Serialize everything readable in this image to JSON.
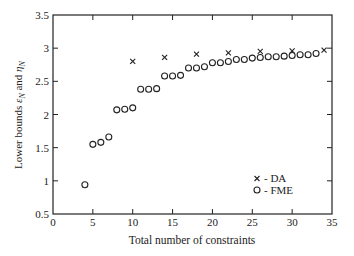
{
  "chart_data": {
    "type": "scatter",
    "title": "",
    "xlabel": "Total number of constraints",
    "ylabel": "Lower bounds ε_N and η_N",
    "xlim": [
      0,
      35
    ],
    "ylim": [
      0.5,
      3.5
    ],
    "xticks": [
      0,
      5,
      10,
      15,
      20,
      25,
      30,
      35
    ],
    "yticks": [
      0.5,
      1,
      1.5,
      2,
      2.5,
      3,
      3.5
    ],
    "xtick_labels": [
      "0",
      "5",
      "10",
      "15",
      "20",
      "25",
      "30",
      "35"
    ],
    "ytick_labels": [
      "0.5",
      "1",
      "1.5",
      "2",
      "2.5",
      "3",
      "3.5"
    ],
    "grid": false,
    "legend_position": "lower right",
    "series": [
      {
        "name": "DA",
        "legend_label": "- DA",
        "marker": "x",
        "x": [
          10,
          14,
          18,
          22,
          26,
          30,
          34
        ],
        "y": [
          2.8,
          2.86,
          2.91,
          2.93,
          2.95,
          2.96,
          2.97
        ]
      },
      {
        "name": "FME",
        "legend_label": "- FME",
        "marker": "o",
        "x": [
          4,
          5,
          6,
          7,
          8,
          9,
          10,
          11,
          12,
          13,
          14,
          15,
          16,
          17,
          18,
          19,
          20,
          21,
          22,
          23,
          24,
          25,
          26,
          27,
          28,
          29,
          30,
          31,
          32,
          33
        ],
        "y": [
          0.94,
          1.55,
          1.58,
          1.66,
          2.07,
          2.08,
          2.1,
          2.38,
          2.38,
          2.39,
          2.58,
          2.58,
          2.59,
          2.7,
          2.7,
          2.72,
          2.78,
          2.78,
          2.8,
          2.83,
          2.83,
          2.85,
          2.86,
          2.87,
          2.87,
          2.88,
          2.89,
          2.9,
          2.9,
          2.92
        ]
      }
    ]
  },
  "labels": {
    "xlabel": "Total number of constraints",
    "ylabel_main": "Lower bounds ",
    "ylabel_eps": "ε",
    "ylabel_and": " and ",
    "ylabel_eta": "η",
    "ylabel_sub": "N",
    "legend_da": "- DA",
    "legend_fme": "- FME"
  }
}
